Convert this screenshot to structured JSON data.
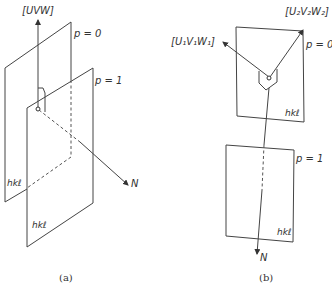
{
  "panel_a": {
    "caption": "(a)",
    "labels": {
      "zone_axis": "[UVW]",
      "plane_p0": "p = 0",
      "plane_p1": "p = 1",
      "normal": "N",
      "plane_hkl_back": "hkℓ",
      "plane_hkl_front": "hkℓ"
    }
  },
  "panel_b": {
    "caption": "(b)",
    "labels": {
      "zone_axis_1": "[U₁V₁W₁]",
      "zone_axis_2": "[U₂V₂W₂]",
      "plane_p0": "p = 0",
      "plane_p1": "p = 1",
      "normal": "N",
      "plane_hkl_top": "hkℓ",
      "plane_hkl_bottom": "hkℓ"
    }
  }
}
